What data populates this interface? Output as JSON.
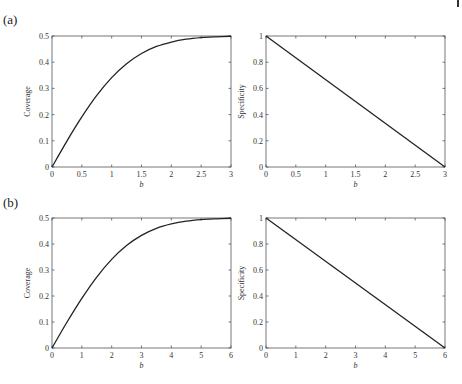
{
  "page": {
    "edge_mark": "|"
  },
  "chart_data": [
    {
      "panel": "(a)",
      "type": "line",
      "title": "",
      "xlabel": "b",
      "ylabel": "Coverage",
      "xlim": [
        0,
        3
      ],
      "ylim": [
        0,
        0.5
      ],
      "xticks": [
        "0",
        "0.5",
        "1",
        "1.5",
        "2",
        "2.5",
        "3"
      ],
      "yticks": [
        "0",
        "0.1",
        "0.2",
        "0.3",
        "0.4",
        "0.5"
      ],
      "grid": false,
      "series": [
        {
          "name": "Coverage",
          "x": [
            0,
            0.25,
            0.5,
            0.75,
            1.0,
            1.25,
            1.5,
            1.75,
            2.0,
            2.25,
            2.5,
            2.75,
            3.0
          ],
          "y": [
            0,
            0.099,
            0.191,
            0.273,
            0.341,
            0.394,
            0.433,
            0.46,
            0.477,
            0.488,
            0.494,
            0.497,
            0.499
          ]
        }
      ]
    },
    {
      "panel": "(a)",
      "type": "line",
      "title": "",
      "xlabel": "b",
      "ylabel": "Specificity",
      "xlim": [
        0,
        3
      ],
      "ylim": [
        0,
        1
      ],
      "xticks": [
        "0",
        "0.5",
        "1",
        "1.5",
        "2",
        "2.5",
        "3"
      ],
      "yticks": [
        "0",
        "0.2",
        "0.4",
        "0.6",
        "0.8",
        "1"
      ],
      "grid": false,
      "series": [
        {
          "name": "Specificity",
          "x": [
            0,
            3
          ],
          "y": [
            1,
            0
          ]
        }
      ]
    },
    {
      "panel": "(b)",
      "type": "line",
      "title": "",
      "xlabel": "b",
      "ylabel": "Coverage",
      "xlim": [
        0,
        6
      ],
      "ylim": [
        0,
        0.5
      ],
      "xticks": [
        "0",
        "1",
        "2",
        "3",
        "4",
        "5",
        "6"
      ],
      "yticks": [
        "0",
        "0.1",
        "0.2",
        "0.3",
        "0.4",
        "0.5"
      ],
      "grid": false,
      "series": [
        {
          "name": "Coverage",
          "x": [
            0,
            0.5,
            1,
            1.5,
            2,
            2.5,
            3,
            3.5,
            4,
            4.5,
            5,
            5.5,
            6
          ],
          "y": [
            0,
            0.099,
            0.191,
            0.273,
            0.341,
            0.394,
            0.433,
            0.46,
            0.477,
            0.488,
            0.494,
            0.497,
            0.499
          ]
        }
      ]
    },
    {
      "panel": "(b)",
      "type": "line",
      "title": "",
      "xlabel": "b",
      "ylabel": "Specificity",
      "xlim": [
        0,
        6
      ],
      "ylim": [
        0,
        1
      ],
      "xticks": [
        "0",
        "1",
        "2",
        "3",
        "4",
        "5",
        "6"
      ],
      "yticks": [
        "0",
        "0.2",
        "0.4",
        "0.6",
        "0.8",
        "1"
      ],
      "grid": false,
      "series": [
        {
          "name": "Specificity",
          "x": [
            0,
            6
          ],
          "y": [
            1,
            0
          ]
        }
      ]
    }
  ]
}
